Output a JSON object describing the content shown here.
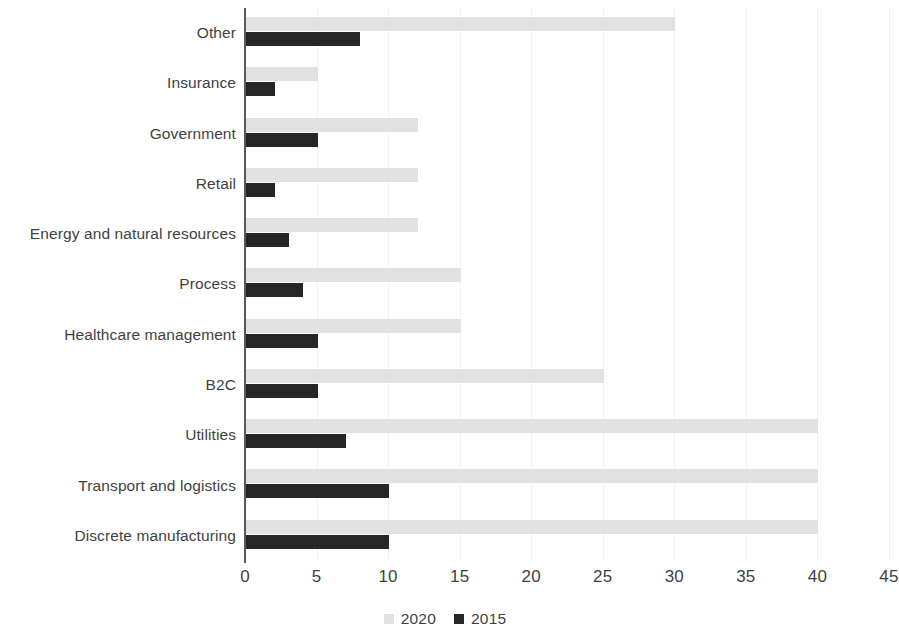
{
  "chart_data": {
    "type": "bar",
    "orientation": "horizontal",
    "title": "",
    "xlabel": "",
    "ylabel": "",
    "xlim": [
      0,
      45
    ],
    "xticks": [
      "0",
      "5",
      "10",
      "15",
      "20",
      "25",
      "30",
      "35",
      "40",
      "45"
    ],
    "grid": true,
    "grid_axis": "x",
    "legend_position": "bottom",
    "categories": [
      "Other",
      "Insurance",
      "Government",
      "Retail",
      "Energy and natural resources",
      "Process",
      "Healthcare management",
      "B2C",
      "Utilities",
      "Transport and logistics",
      "Discrete manufacturing"
    ],
    "series": [
      {
        "name": "2020",
        "color": "#e2e2e2",
        "values": [
          30,
          5,
          12,
          12,
          12,
          15,
          15,
          25,
          40,
          40,
          40
        ]
      },
      {
        "name": "2015",
        "color": "#262626",
        "values": [
          8,
          2,
          5,
          2,
          3,
          4,
          5,
          5,
          7,
          10,
          10
        ]
      }
    ]
  }
}
